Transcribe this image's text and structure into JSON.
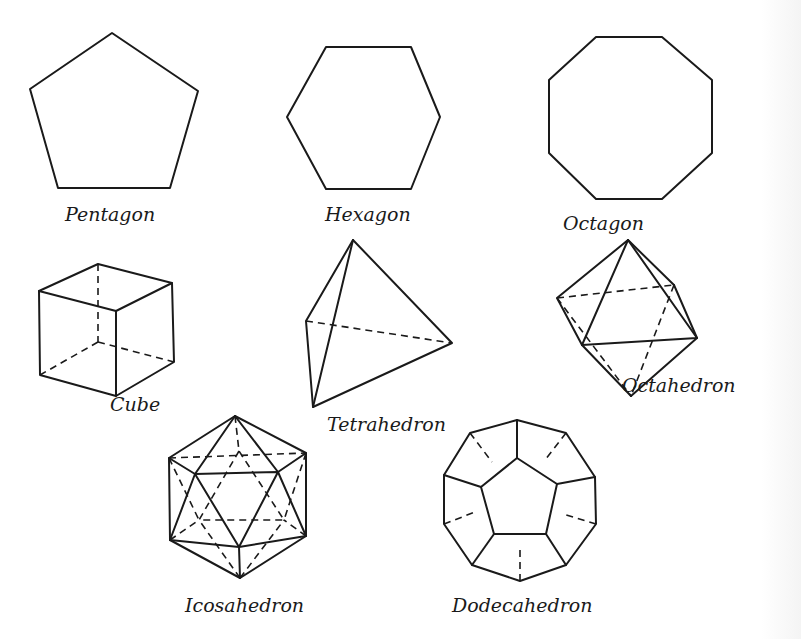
{
  "figure": {
    "labels": {
      "pentagon": "Pentagon",
      "hexagon": "Hexagon",
      "octagon": "Octagon",
      "cube": "Cube",
      "tetrahedron": "Tetrahedron",
      "octahedron": "Octahedron",
      "icosahedron": "Icosahedron",
      "dodecahedron": "Dodecahedron"
    },
    "colors": {
      "ink": "#1a1a1a",
      "paper": "#ffffff"
    }
  }
}
